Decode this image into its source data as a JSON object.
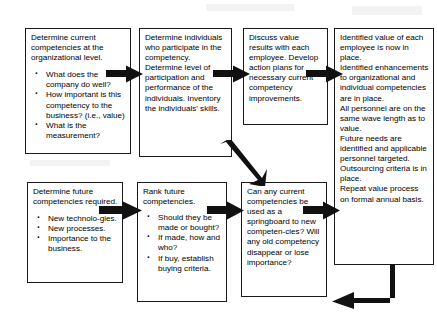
{
  "diagram": {
    "line_color": "#1a1a1a",
    "arrow_color": "#111111",
    "background": "#ffffff",
    "boxes": [
      {
        "id": "box-1",
        "name": "determine-current-competencies",
        "heading": "Determine current competencies at the organizational level.",
        "bullets": [
          "What does the company do well?",
          "How important is this competency to the business? (i.e., value)",
          "What is the measurement?"
        ]
      },
      {
        "id": "box-2",
        "name": "determine-individuals",
        "heading": "Determine individuals who participate in the competency. Determine level of participation and performance of the individuals. Inventory the individuals' skills.",
        "bullets": []
      },
      {
        "id": "box-3",
        "name": "discuss-value-results",
        "heading": "Discuss value results with each employee. Develop action plans for necessary current competency improvements.",
        "bullets": []
      },
      {
        "id": "box-4",
        "name": "identified-value-outcomes",
        "paragraphs": [
          "Identified value of each employee is now in place.",
          "Identified enhancements to organizational and individual competencies are in place.",
          "All personnel are on the same wave length as to value.",
          "Future needs are identified and applicable personnel targeted.",
          "Outsourcing criteria is in place.",
          "Repeat value process on formal annual basis."
        ]
      },
      {
        "id": "box-5",
        "name": "determine-future-competencies",
        "heading": "Determine future competencies required.",
        "bullets": [
          "New technolo-gies.",
          "New processes.",
          "Importance to the business."
        ]
      },
      {
        "id": "box-6",
        "name": "rank-future-competencies",
        "heading": "Rank future competencies.",
        "bullets": [
          "Should they be made or bought?",
          "If made, how and who?",
          "If buy, establish buying criteria."
        ]
      },
      {
        "id": "box-7",
        "name": "springboard-question",
        "heading": "Can any current competencies be used as a springboard to new competen-cies? Will any old competency disappear or lose importance?",
        "bullets": []
      }
    ],
    "arrows": [
      {
        "name": "arrow-box1-to-box2",
        "direction": "right"
      },
      {
        "name": "arrow-box2-to-box3",
        "direction": "right"
      },
      {
        "name": "arrow-box3-to-box4",
        "direction": "right"
      },
      {
        "name": "arrow-box2-to-box7",
        "direction": "down-right"
      },
      {
        "name": "arrow-box5-to-box6",
        "direction": "right"
      },
      {
        "name": "arrow-box6-to-box7",
        "direction": "right"
      },
      {
        "name": "arrow-box7-to-box4",
        "direction": "right"
      },
      {
        "name": "arrow-box4-return-loop",
        "direction": "down-then-left"
      }
    ]
  }
}
